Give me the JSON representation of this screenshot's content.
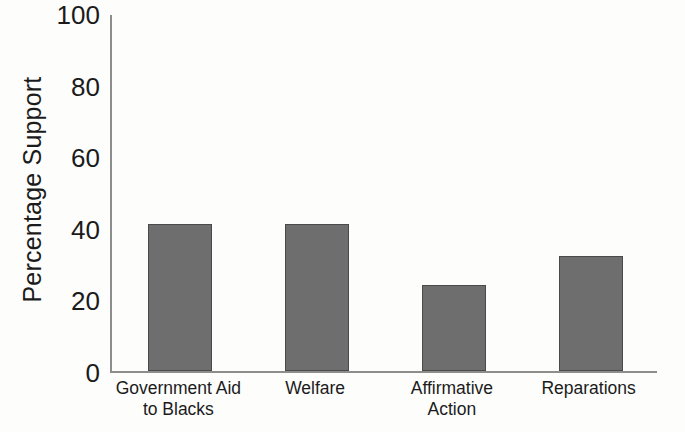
{
  "chart_data": {
    "type": "bar",
    "title": "",
    "xlabel": "",
    "ylabel": "Percentage Support",
    "categories": [
      "Government Aid to Blacks",
      "Welfare",
      "Affirmative Action",
      "Reparations"
    ],
    "category_lines": [
      [
        "Government Aid",
        "to Blacks"
      ],
      [
        "Welfare",
        ""
      ],
      [
        "Affirmative",
        "Action"
      ],
      [
        "Reparations",
        ""
      ]
    ],
    "values": [
      41,
      41,
      24,
      32
    ],
    "ylim": [
      0,
      100
    ],
    "yticks": [
      "0",
      "20",
      "40",
      "60",
      "80",
      "100"
    ],
    "ytick_values": [
      0,
      20,
      40,
      60,
      80,
      100
    ],
    "grid": false,
    "legend": null,
    "bar_color": "#6e6e6e",
    "bar_border_color": "#4a4a4a",
    "axis_color": "#8d8d8d",
    "text_color": "#1b1b1b",
    "background_color": "#fdfdfc"
  }
}
